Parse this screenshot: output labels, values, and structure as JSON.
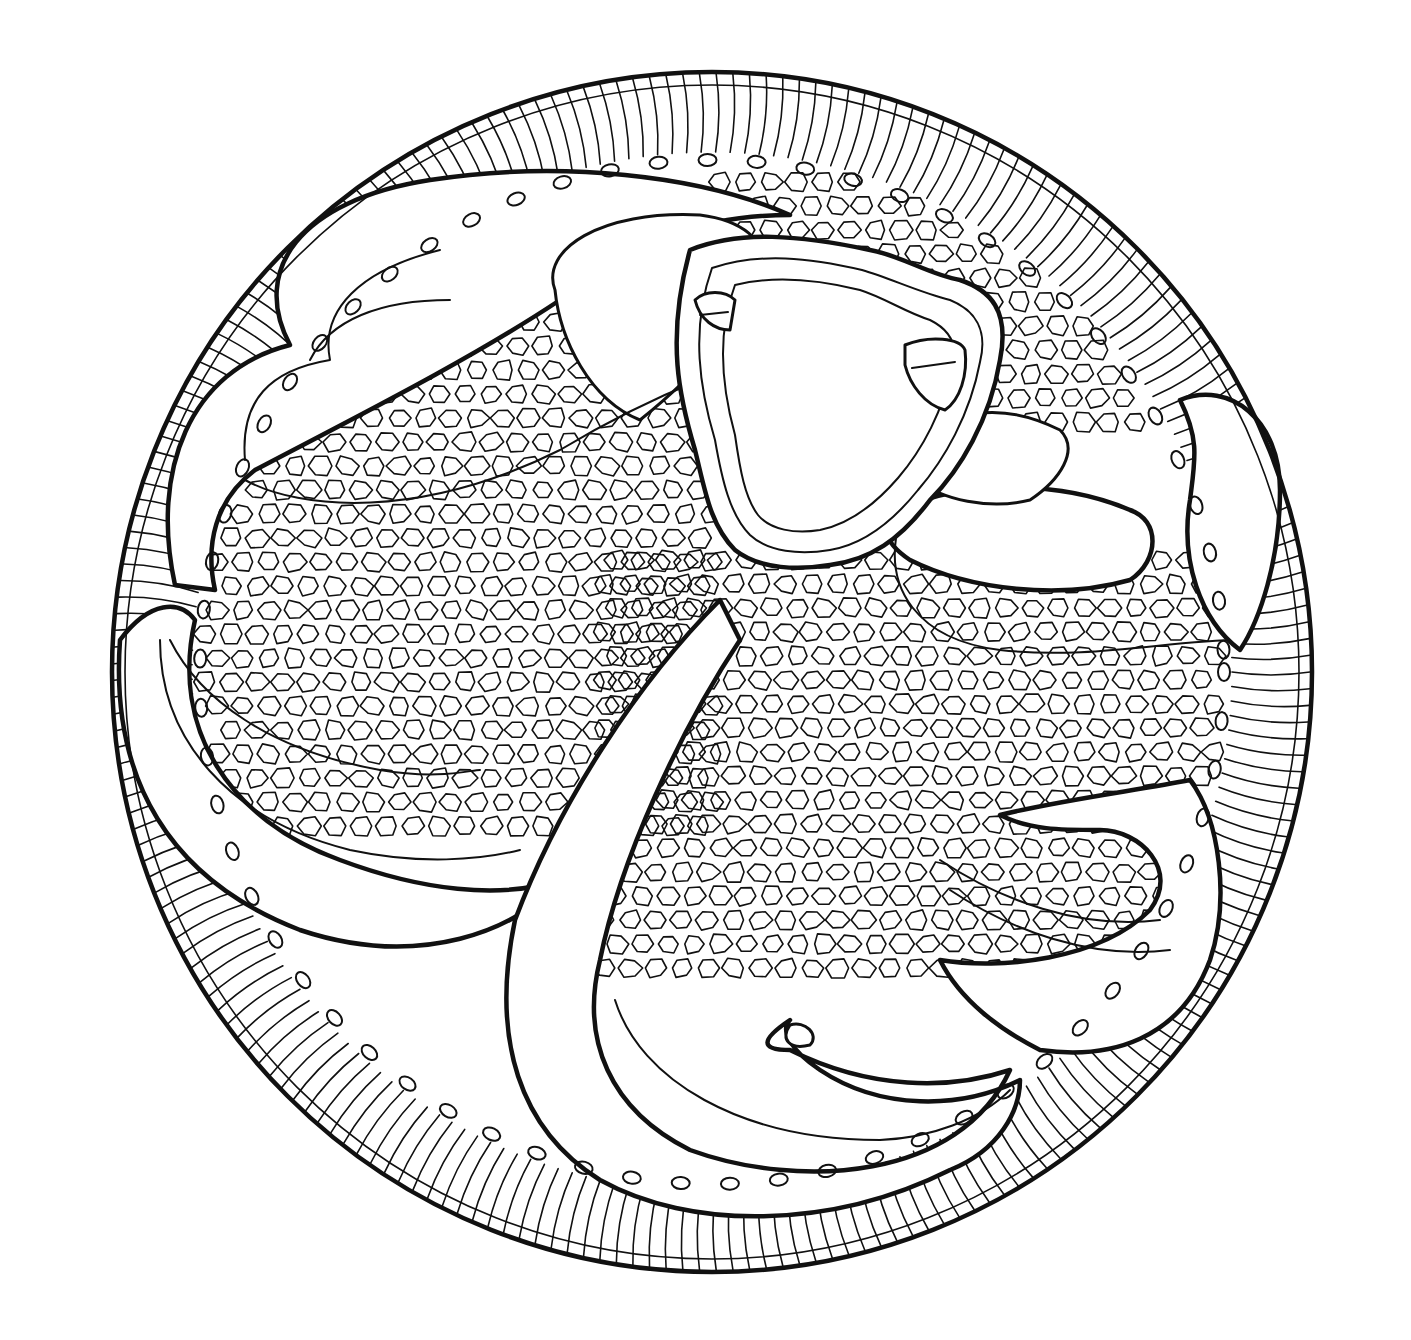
{
  "artwork": {
    "title": "Circular line-art mandala coloring page",
    "style": "black ink line art on white",
    "colors": {
      "ink": "#111111",
      "paper": "#ffffff"
    },
    "elements": [
      "outer-circle-frame",
      "wavy-hatching-band",
      "beaded-scallop-borders",
      "crescent-petal-lobes",
      "cobblestone-texture",
      "central-concentric-shape",
      "hook-shaped-sweep"
    ]
  }
}
